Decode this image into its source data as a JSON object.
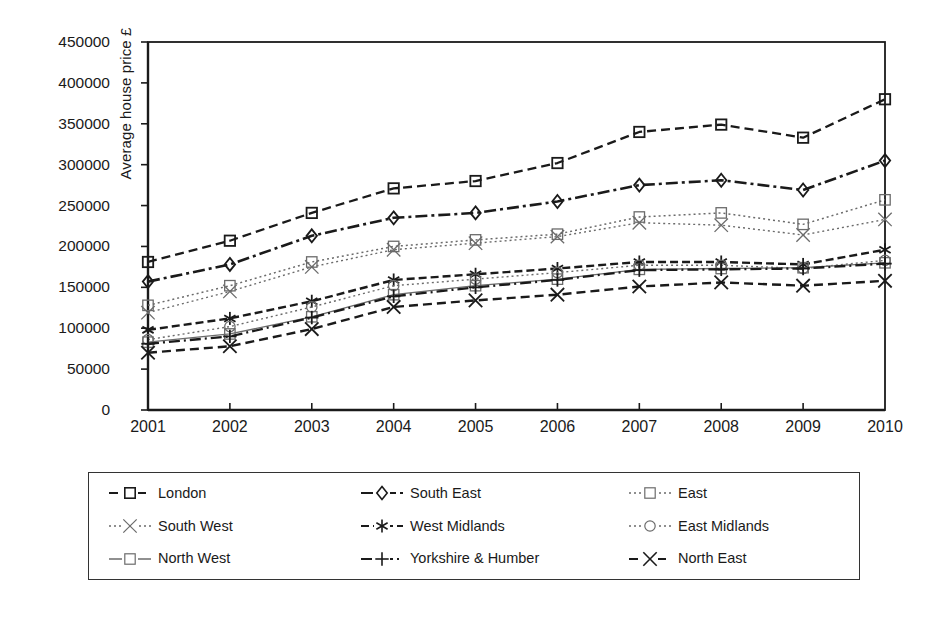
{
  "chart_data": {
    "type": "line",
    "title": "",
    "xlabel": "",
    "ylabel": "Average house price £",
    "x": [
      2001,
      2002,
      2003,
      2004,
      2005,
      2006,
      2007,
      2008,
      2009,
      2010
    ],
    "categories": [
      "2001",
      "2002",
      "2003",
      "2004",
      "2005",
      "2006",
      "2007",
      "2008",
      "2009",
      "2010"
    ],
    "ylim": [
      0,
      450000
    ],
    "yticks": [
      0,
      50000,
      100000,
      150000,
      200000,
      250000,
      300000,
      350000,
      400000,
      450000
    ],
    "ytick_labels": [
      "0",
      "50000",
      "100000",
      "150000",
      "200000",
      "250000",
      "300000",
      "350000",
      "400000",
      "450000"
    ],
    "grid": false,
    "legend_position": "bottom",
    "series": [
      {
        "name": "London",
        "marker": "square",
        "dash": "dashed",
        "values": [
          181000,
          207000,
          241000,
          271000,
          280000,
          302000,
          340000,
          349000,
          333000,
          380000
        ]
      },
      {
        "name": "South East",
        "marker": "diamond",
        "dash": "dashdot",
        "values": [
          157000,
          178000,
          213000,
          235000,
          241000,
          255000,
          275000,
          281000,
          269000,
          305000
        ]
      },
      {
        "name": "East",
        "marker": "square",
        "dash": "dotted",
        "values": [
          128000,
          152000,
          181000,
          200000,
          208000,
          215000,
          236000,
          241000,
          227000,
          257000
        ]
      },
      {
        "name": "South West",
        "marker": "cross",
        "dash": "dotted",
        "values": [
          119000,
          145000,
          175000,
          196000,
          204000,
          212000,
          229000,
          226000,
          214000,
          233000
        ]
      },
      {
        "name": "West Midlands",
        "marker": "asterisk",
        "dash": "dashed",
        "values": [
          98000,
          112000,
          133000,
          159000,
          166000,
          173000,
          181000,
          181000,
          178000,
          196000
        ]
      },
      {
        "name": "East Midlands",
        "marker": "circle",
        "dash": "dotted",
        "values": [
          86000,
          102000,
          126000,
          152000,
          160000,
          168000,
          177000,
          177000,
          173000,
          183000
        ]
      },
      {
        "name": "North West",
        "marker": "square",
        "dash": "solid",
        "values": [
          83000,
          93000,
          114000,
          141000,
          152000,
          160000,
          172000,
          173000,
          174000,
          180000
        ]
      },
      {
        "name": "Yorkshire & Humber",
        "marker": "plus",
        "dash": "solid",
        "values": [
          81000,
          90000,
          113000,
          139000,
          150000,
          159000,
          171000,
          172000,
          173000,
          179000
        ]
      },
      {
        "name": "North East",
        "marker": "cross",
        "dash": "dashed",
        "values": [
          70000,
          78000,
          99000,
          126000,
          134000,
          141000,
          151000,
          156000,
          152000,
          158000
        ]
      }
    ]
  },
  "legend": {
    "items": [
      {
        "label": "London"
      },
      {
        "label": "South East"
      },
      {
        "label": "East"
      },
      {
        "label": "South West"
      },
      {
        "label": "West Midlands"
      },
      {
        "label": "East Midlands"
      },
      {
        "label": "North West"
      },
      {
        "label": "Yorkshire & Humber"
      },
      {
        "label": "North East"
      }
    ]
  },
  "colors": {
    "ink": "#1a1a1a",
    "axis": "#222222",
    "faint": "#6b6b6b",
    "background": "#ffffff"
  }
}
